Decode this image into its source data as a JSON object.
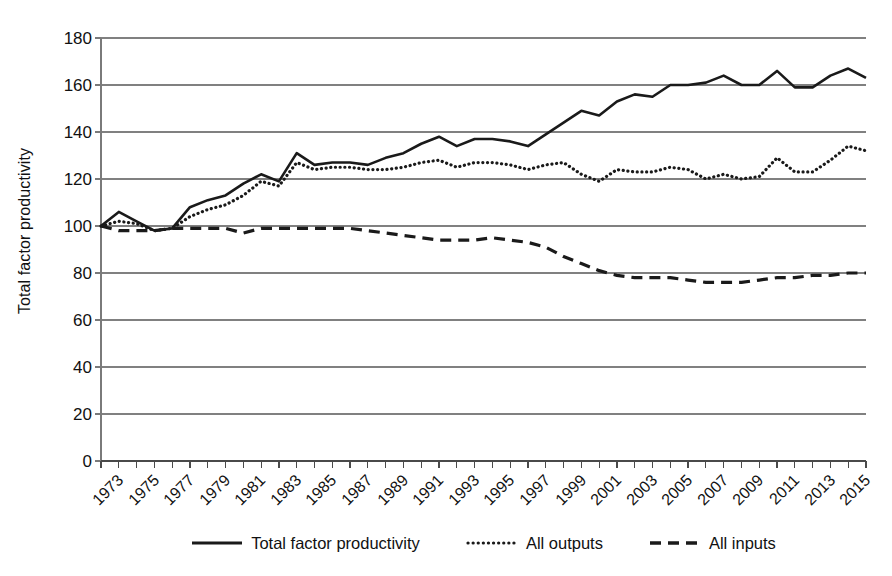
{
  "chart_data": {
    "type": "line",
    "title": "",
    "xlabel": "",
    "ylabel": "Total factor productivity",
    "ylim": [
      0,
      180
    ],
    "yticks": [
      0,
      20,
      40,
      60,
      80,
      100,
      120,
      140,
      160,
      180
    ],
    "grid": true,
    "legend_position": "bottom",
    "x": [
      1973,
      1974,
      1975,
      1976,
      1977,
      1978,
      1979,
      1980,
      1981,
      1982,
      1983,
      1984,
      1985,
      1986,
      1987,
      1988,
      1989,
      1990,
      1991,
      1992,
      1993,
      1994,
      1995,
      1996,
      1997,
      1998,
      1999,
      2000,
      2001,
      2002,
      2003,
      2004,
      2005,
      2006,
      2007,
      2008,
      2009,
      2010,
      2011,
      2012,
      2013,
      2014,
      2015,
      2016
    ],
    "xtick_labels": [
      "1973",
      "1975",
      "1977",
      "1979",
      "1981",
      "1983",
      "1985",
      "1987",
      "1989",
      "1991",
      "1993",
      "1995",
      "1997",
      "1999",
      "2001",
      "2003",
      "2005",
      "2007",
      "2009",
      "2011",
      "2013",
      "2015"
    ],
    "series": [
      {
        "name": "Total factor productivity",
        "style": "solid",
        "color": "#1a1a1a",
        "values": [
          100,
          106,
          102,
          98,
          99,
          108,
          111,
          113,
          118,
          122,
          119,
          131,
          126,
          127,
          127,
          126,
          129,
          131,
          135,
          138,
          134,
          137,
          137,
          136,
          134,
          139,
          144,
          149,
          147,
          153,
          156,
          155,
          160,
          160,
          161,
          164,
          160,
          160,
          166,
          159,
          159,
          164,
          167,
          163
        ]
      },
      {
        "name": "All outputs",
        "style": "dotted",
        "color": "#1a1a1a",
        "values": [
          100,
          102,
          101,
          98,
          99,
          104,
          107,
          109,
          113,
          119,
          117,
          127,
          124,
          125,
          125,
          124,
          124,
          125,
          127,
          128,
          125,
          127,
          127,
          126,
          124,
          126,
          127,
          122,
          119,
          124,
          123,
          123,
          125,
          124,
          120,
          122,
          120,
          121,
          129,
          123,
          123,
          128,
          134,
          132
        ]
      },
      {
        "name": "All inputs",
        "style": "dashed",
        "color": "#1a1a1a",
        "values": [
          100,
          98,
          98,
          98,
          99,
          99,
          99,
          99,
          97,
          99,
          99,
          99,
          99,
          99,
          99,
          98,
          97,
          96,
          95,
          94,
          94,
          94,
          95,
          94,
          93,
          91,
          87,
          84,
          81,
          79,
          78,
          78,
          78,
          77,
          76,
          76,
          76,
          77,
          78,
          78,
          79,
          79,
          80,
          80
        ]
      }
    ]
  },
  "legend": {
    "items": [
      {
        "label": "Total factor productivity",
        "icon": "solid-line-icon"
      },
      {
        "label": "All outputs",
        "icon": "dotted-line-icon"
      },
      {
        "label": "All inputs",
        "icon": "dashed-line-icon"
      }
    ]
  }
}
